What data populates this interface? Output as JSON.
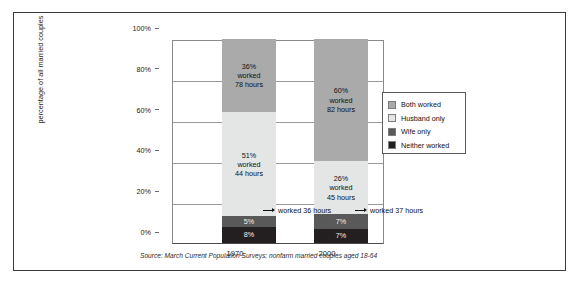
{
  "chart_data": {
    "type": "bar",
    "subtype": "stacked-100-percent",
    "title": "",
    "xlabel": "",
    "ylabel": "percentage of all married couples",
    "ylim": [
      0,
      100
    ],
    "ytick_labels": [
      "0%",
      "20%",
      "40%",
      "60%",
      "80%",
      "100%"
    ],
    "ytick_values": [
      0,
      20,
      40,
      60,
      80,
      100
    ],
    "grid": true,
    "legend_position": "right",
    "categories": [
      "1970",
      "2000"
    ],
    "series": [
      {
        "name": "Both worked",
        "key": "both",
        "color": "#aaaaaa",
        "values": [
          36,
          60
        ]
      },
      {
        "name": "Husband only",
        "key": "husband",
        "color": "#e3e6e5",
        "values": [
          51,
          26
        ]
      },
      {
        "name": "Wife only",
        "key": "wife",
        "color": "#595959",
        "values": [
          5,
          7
        ]
      },
      {
        "name": "Neither worked",
        "key": "neither",
        "color": "#231f20",
        "values": [
          8,
          7
        ]
      }
    ],
    "bar_labels": {
      "1970": {
        "both": {
          "pct": "36%",
          "line2": "worked",
          "line3": "78 hours"
        },
        "husband": {
          "pct": "51%",
          "line2": "worked",
          "line3": "44 hours"
        },
        "wife": {
          "pct": "5%",
          "line2": "",
          "line3": ""
        },
        "neither": {
          "pct": "8%",
          "line2": "",
          "line3": ""
        }
      },
      "2000": {
        "both": {
          "pct": "60%",
          "line2": "worked",
          "line3": "82 hours"
        },
        "husband": {
          "pct": "26%",
          "line2": "worked",
          "line3": "45 hours"
        },
        "wife": {
          "pct": "7%",
          "line2": "",
          "line3": ""
        },
        "neither": {
          "pct": "7%",
          "line2": "",
          "line3": ""
        }
      }
    },
    "annotations": [
      {
        "id": "anno-1970",
        "text": "worked 36 hours",
        "attached_to": "1970 / Wife only"
      },
      {
        "id": "anno-2000",
        "text": "worked 37 hours",
        "attached_to": "2000 / Wife only"
      }
    ],
    "source_note": "Source: March Current Population Surveys; nonfarm married couples aged 18-64"
  },
  "axis": {
    "y_label": "percentage of all married couples",
    "ticks": [
      "100%",
      "80%",
      "60%",
      "40%",
      "20%",
      "0%"
    ],
    "x_labels": [
      "1970",
      "2000"
    ]
  },
  "legend": {
    "items": [
      {
        "label": "Both worked",
        "color": "#aaaaaa"
      },
      {
        "label": "Husband only",
        "color": "#e3e6e5"
      },
      {
        "label": "Wife only",
        "color": "#595959"
      },
      {
        "label": "Neither worked",
        "color": "#231f20"
      }
    ]
  },
  "bars": {
    "b1970": {
      "both": {
        "pct": "36%",
        "line2": "worked",
        "line3": "78 hours"
      },
      "husband": {
        "pct": "51%",
        "line2": "worked",
        "line3": "44 hours"
      },
      "wife": {
        "pct": "5%"
      },
      "neither": {
        "pct": "8%"
      }
    },
    "b2000": {
      "both": {
        "pct": "60%",
        "line2": "worked",
        "line3": "82 hours"
      },
      "husband": {
        "pct": "26%",
        "line2": "worked",
        "line3": "45 hours"
      },
      "wife": {
        "pct": "7%"
      },
      "neither": {
        "pct": "7%"
      }
    }
  },
  "annotations": {
    "left": "worked 36 hours",
    "right": "worked 37 hours"
  },
  "source": "Source: March Current Population Surveys; nonfarm married couples aged 18-64"
}
